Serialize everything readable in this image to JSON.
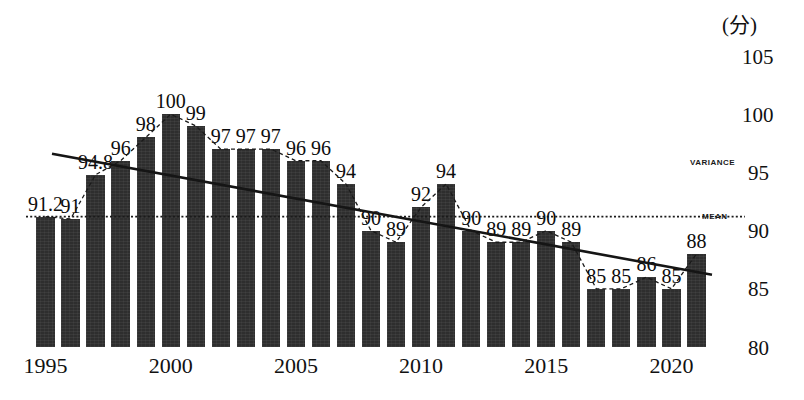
{
  "chart_data": {
    "type": "bar",
    "title": "",
    "xlabel": "",
    "ylabel": "(分)",
    "unit_label": "(分)",
    "ylim": [
      80,
      105
    ],
    "yticks": [
      80,
      85,
      90,
      95,
      100,
      105
    ],
    "ytick_labels": [
      "80",
      "85",
      "90",
      "95",
      "100",
      "105"
    ],
    "xtick_labels": [
      "1995",
      "2000",
      "2005",
      "2010",
      "2015",
      "2020"
    ],
    "xtick_years": [
      1995,
      2000,
      2005,
      2010,
      2015,
      2020
    ],
    "grid": false,
    "legend_position": "right-inline",
    "categories": [
      1995,
      1996,
      1997,
      1998,
      1999,
      2000,
      2001,
      2002,
      2003,
      2004,
      2005,
      2006,
      2007,
      2008,
      2009,
      2010,
      2011,
      2012,
      2013,
      2014,
      2015,
      2016,
      2017,
      2018,
      2019,
      2020,
      2021
    ],
    "values": [
      91.2,
      91,
      94.8,
      96,
      98,
      100,
      99,
      97,
      97,
      97,
      96,
      96,
      94,
      90,
      89,
      92,
      94,
      90,
      89,
      89,
      90,
      89,
      85,
      85,
      86,
      85,
      88
    ],
    "data_labels": [
      "91.2",
      "91",
      "94.8",
      "96",
      "98",
      "100",
      "99",
      "97",
      "97",
      "97",
      "96",
      "96",
      "94",
      "90",
      "89",
      "92",
      "94",
      "90",
      "89",
      "89",
      "90",
      "89",
      "85",
      "85",
      "86",
      "85",
      "88"
    ],
    "series": [
      {
        "name": "VARIANCE",
        "style": "dashed-line",
        "label": "VARIANCE",
        "values": [
          91.2,
          91,
          94.8,
          96,
          98,
          100,
          99,
          97,
          97,
          97,
          96,
          96,
          94,
          90,
          89,
          92,
          94,
          90,
          89,
          89,
          90,
          89,
          85,
          85,
          86,
          85,
          88
        ]
      },
      {
        "name": "MEAN",
        "style": "dotted-horizontal",
        "label": "MEAN",
        "value": 91.2
      },
      {
        "name": "TREND",
        "style": "solid-line",
        "label": "",
        "start": 96.6,
        "end": 86.2
      }
    ],
    "annotations": [
      {
        "text": "VARIANCE",
        "y_value": 95.5
      },
      {
        "text": "MEAN",
        "y_value": 90.4
      }
    ]
  }
}
